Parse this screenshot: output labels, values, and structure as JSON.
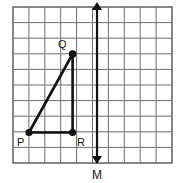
{
  "figure": {
    "type": "coordinate-grid-geometry-figure",
    "background_color": "#ffffff",
    "grid": {
      "columns": 10,
      "rows": 10,
      "left": 13,
      "top": 7,
      "right": 172,
      "bottom": 163,
      "cell_width": 15.9,
      "cell_height": 15.6,
      "line_color": "#6e6e6e",
      "border_color": "#555555",
      "line_width": 1
    },
    "shape": {
      "name": "triangle-pqr",
      "stroke_color": "#111111",
      "stroke_width": 2.6,
      "fill": "none",
      "vertices": [
        {
          "id": "P",
          "label": "P",
          "grid_col": 1,
          "grid_row": 8,
          "x": 29,
          "y": 132.5,
          "label_x": 17,
          "label_y": 146,
          "dot_radius": 3.6
        },
        {
          "id": "Q",
          "label": "Q",
          "grid_col": 4,
          "grid_row": 3,
          "x": 72.6,
          "y": 54,
          "label_x": 58,
          "label_y": 48,
          "dot_radius": 3.8
        },
        {
          "id": "R",
          "label": "R",
          "grid_col": 4,
          "grid_row": 8,
          "x": 72.6,
          "y": 132.5,
          "label_x": 77,
          "label_y": 146,
          "dot_radius": 3.6
        }
      ],
      "edges": [
        {
          "from": "P",
          "to": "Q"
        },
        {
          "from": "Q",
          "to": "R"
        },
        {
          "from": "R",
          "to": "P"
        }
      ]
    },
    "line_m": {
      "name": "line-of-reflection-m",
      "label": "M",
      "label_x": 97,
      "label_y": 179,
      "x": 97,
      "y_top": 4,
      "y_bottom": 162,
      "stroke_color": "#111111",
      "stroke_width": 2.2,
      "arrow_both_ends": true,
      "arrow_size": 5
    }
  }
}
